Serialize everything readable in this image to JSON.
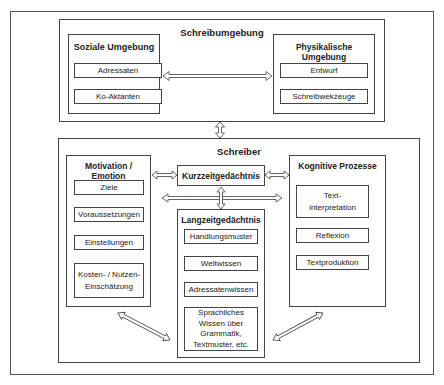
{
  "diagram": {
    "schreibumgebung": {
      "title": "Schreibumgebung",
      "soziale": {
        "title": "Soziale Umgebung",
        "items": [
          "Adressaten",
          "Ko-Aktanten"
        ]
      },
      "physikalische": {
        "title": "Physikalische Umgebung",
        "items": [
          "Entwurf",
          "Schreibwekzeuge"
        ]
      }
    },
    "schreiber": {
      "title": "Schreiber",
      "motivation": {
        "title": "Motivation / Emotion",
        "items": [
          "Ziele",
          "Voraussetzungen",
          "Einstellungen",
          "Kosten- / Nutzen-\nEinschätzung"
        ]
      },
      "kurzzeit": {
        "title": "Kurzzeitgedächtnis"
      },
      "langzeit": {
        "title": "Langzeitgedächtnis",
        "items": [
          "Handlungsmuster",
          "Weltwissen",
          "Adressatenwissen",
          "Sprachliches\nWissen über\nGrammatik,\nTextmuster, etc."
        ]
      },
      "kognitive": {
        "title": "Kognitive Prozesse",
        "items": [
          "Text-\ninterpretation",
          "Reflexion",
          "Textproduktion"
        ]
      }
    },
    "arrows": [
      "soziale-physikalische (bidirectional)",
      "schreibumgebung-schreiber (bidirectional)",
      "motivation-kurzzeit (bidirectional)",
      "kurzzeit-kognitive (bidirectional)",
      "kurzzeit-langzeit (bidirectional)",
      "motivation-kognitive (bidirectional)",
      "motivation-langzeit (bidirectional, diagonal)",
      "langzeit-kognitive (bidirectional, diagonal)"
    ],
    "colors": {
      "border": "#444444",
      "arrow": "#555555",
      "background": "#ffffff"
    }
  }
}
